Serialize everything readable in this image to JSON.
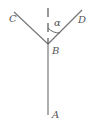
{
  "diagram": {
    "labels": {
      "C": "C",
      "D": "D",
      "alpha": "α",
      "B": "B",
      "A": "A"
    },
    "segments": [
      {
        "from": "B",
        "to": "C"
      },
      {
        "from": "B",
        "to": "D"
      },
      {
        "from": "B",
        "to": "A"
      }
    ],
    "reference_line": "vertical dashed line above B",
    "angle": {
      "name": "α",
      "between": [
        "vertical",
        "BD"
      ]
    }
  }
}
